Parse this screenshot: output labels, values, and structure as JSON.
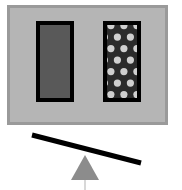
{
  "figure": {
    "width": 182,
    "height": 190,
    "background_color": "#ffffff"
  },
  "panel": {
    "name": "container-panel",
    "x": 7,
    "y": 5,
    "width": 161,
    "height": 120,
    "fill_color": "#b5b5b5",
    "border_color": "#9a9a9a",
    "border_width": 3
  },
  "blocks": [
    {
      "id": "left-block",
      "label": "solid block",
      "x": 36,
      "y": 21,
      "width": 38,
      "height": 81,
      "fill_color": "#595959",
      "border_color": "#000000",
      "border_width": 4,
      "pattern": "solid"
    },
    {
      "id": "right-block",
      "label": "dotted block",
      "x": 103,
      "y": 21,
      "width": 38,
      "height": 81,
      "fill_color": "#2b2b2b",
      "border_color": "#000000",
      "border_width": 4,
      "pattern": "polka-dots",
      "dot_color": "#cfcfcf",
      "dot_radius": 3.6,
      "dot_columns": 3,
      "dot_rows": 7,
      "dot_spacing_x": 13,
      "dot_spacing_y": 11.5,
      "dot_stagger": true
    }
  ],
  "lever": {
    "name": "tilted-beam",
    "x1": 32,
    "y1": 135,
    "x2": 141,
    "y2": 163,
    "color": "#000000",
    "thickness": 5,
    "tilt_direction": "down-right"
  },
  "fulcrum": {
    "name": "triangle-fulcrum",
    "apex_x": 85,
    "apex_y": 155,
    "base_left_x": 71,
    "base_right_x": 99,
    "base_y": 180,
    "fill_color": "#8c8c8c",
    "stem": {
      "x": 85,
      "top_y": 176,
      "bottom_y": 190,
      "width": 2,
      "color": "#d8d8d8"
    }
  }
}
